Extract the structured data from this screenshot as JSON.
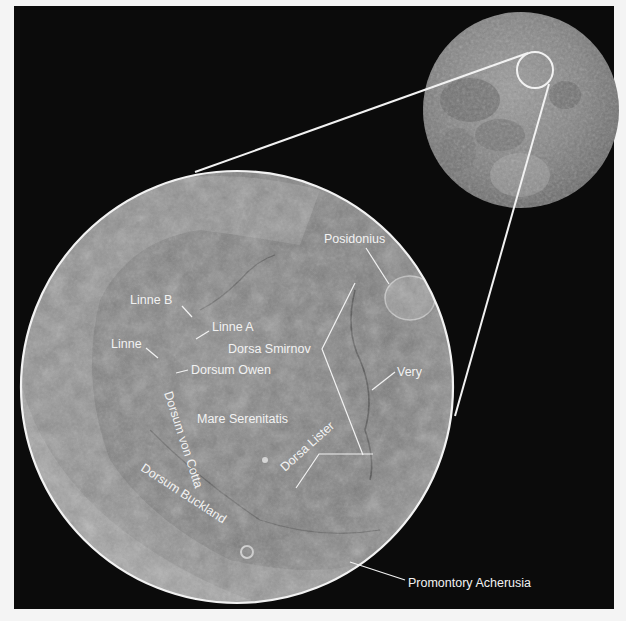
{
  "figure": {
    "colors": {
      "background": "#0b0b0b",
      "frame": "#f4f4f4",
      "line": "#f2f2f2",
      "label": "#f2f2f2"
    }
  },
  "labels": {
    "posidonius": "Posidonius",
    "linne_b": "Linne B",
    "linne_a": "Linne A",
    "linne": "Linne",
    "dorsa_smirnov": "Dorsa Smirnov",
    "dorsum_owen": "Dorsum Owen",
    "very": "Very",
    "mare_serenitatis": "Mare Serenitatis",
    "dorsum_von_cotta": "Dorsum von Cotta",
    "dorsa_lister": "Dorsa Lister",
    "dorsum_buckland": "Dorsum Buckland",
    "promontory_acherusia": "Promontory Acherusia"
  }
}
